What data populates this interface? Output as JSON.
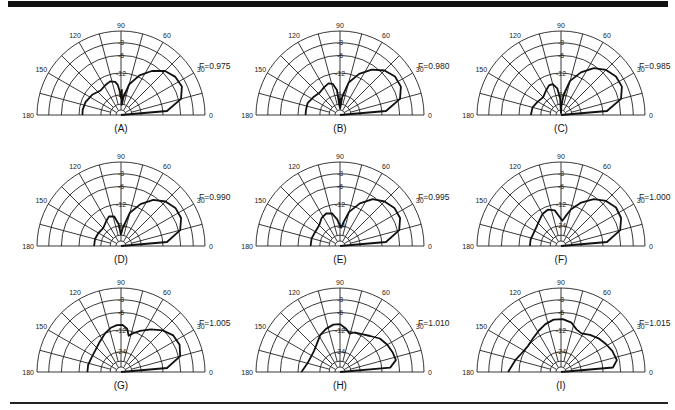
{
  "figure": {
    "panels_layout": "3x3",
    "radial_scale_db": [
      "0",
      "-3",
      "-6",
      "-12",
      "-24"
    ],
    "angle_ticks": [
      "0",
      "30",
      "60",
      "90",
      "120",
      "150",
      "180"
    ]
  },
  "chart_data": [
    {
      "type": "polar",
      "label": "(A)",
      "annotation": "F=0.975",
      "angles_deg": [
        0,
        30,
        60,
        90,
        120,
        150,
        180
      ],
      "radial_ticks_db": [
        -3,
        -6,
        -12,
        -24
      ],
      "curve": [
        [
          0,
          0.0
        ],
        [
          5,
          0.55
        ],
        [
          15,
          0.74
        ],
        [
          25,
          0.8
        ],
        [
          35,
          0.79
        ],
        [
          45,
          0.74
        ],
        [
          55,
          0.64
        ],
        [
          65,
          0.52
        ],
        [
          75,
          0.38
        ],
        [
          82,
          0.22
        ],
        [
          86,
          0.12
        ],
        [
          88,
          0.3
        ],
        [
          90,
          0.2
        ],
        [
          93,
          0.28
        ],
        [
          96,
          0.36
        ],
        [
          100,
          0.4
        ],
        [
          108,
          0.42
        ],
        [
          118,
          0.4
        ],
        [
          130,
          0.38
        ],
        [
          145,
          0.42
        ],
        [
          160,
          0.45
        ],
        [
          172,
          0.46
        ],
        [
          180,
          0.46
        ]
      ]
    },
    {
      "type": "polar",
      "label": "(B)",
      "annotation": "F=0.980",
      "angles_deg": [
        0,
        30,
        60,
        90,
        120,
        150,
        180
      ],
      "radial_ticks_db": [
        -3,
        -6,
        -12,
        -24
      ],
      "curve": [
        [
          0,
          0.0
        ],
        [
          5,
          0.55
        ],
        [
          15,
          0.74
        ],
        [
          25,
          0.8
        ],
        [
          35,
          0.8
        ],
        [
          45,
          0.75
        ],
        [
          55,
          0.66
        ],
        [
          65,
          0.54
        ],
        [
          75,
          0.4
        ],
        [
          83,
          0.22
        ],
        [
          88,
          0.08
        ],
        [
          90,
          0.2
        ],
        [
          93,
          0.1
        ],
        [
          97,
          0.3
        ],
        [
          103,
          0.38
        ],
        [
          110,
          0.4
        ],
        [
          120,
          0.38
        ],
        [
          132,
          0.36
        ],
        [
          145,
          0.38
        ],
        [
          160,
          0.41
        ],
        [
          172,
          0.41
        ],
        [
          180,
          0.41
        ]
      ]
    },
    {
      "type": "polar",
      "label": "(C)",
      "annotation": "F=0.985",
      "angles_deg": [
        0,
        30,
        60,
        90,
        120,
        150,
        180
      ],
      "radial_ticks_db": [
        -3,
        -6,
        -12,
        -24
      ],
      "curve": [
        [
          0,
          0.0
        ],
        [
          5,
          0.55
        ],
        [
          15,
          0.74
        ],
        [
          25,
          0.8
        ],
        [
          35,
          0.8
        ],
        [
          45,
          0.76
        ],
        [
          55,
          0.68
        ],
        [
          65,
          0.56
        ],
        [
          75,
          0.42
        ],
        [
          83,
          0.24
        ],
        [
          88,
          0.1
        ],
        [
          90,
          0.02
        ],
        [
          93,
          0.2
        ],
        [
          98,
          0.32
        ],
        [
          105,
          0.38
        ],
        [
          112,
          0.38
        ],
        [
          122,
          0.34
        ],
        [
          135,
          0.3
        ],
        [
          150,
          0.32
        ],
        [
          165,
          0.35
        ],
        [
          180,
          0.36
        ]
      ]
    },
    {
      "type": "polar",
      "label": "(D)",
      "annotation": "F=0.990",
      "angles_deg": [
        0,
        30,
        60,
        90,
        120,
        150,
        180
      ],
      "radial_ticks_db": [
        -3,
        -6,
        -12,
        -24
      ],
      "curve": [
        [
          0,
          0.0
        ],
        [
          5,
          0.55
        ],
        [
          15,
          0.73
        ],
        [
          25,
          0.79
        ],
        [
          35,
          0.79
        ],
        [
          45,
          0.75
        ],
        [
          55,
          0.67
        ],
        [
          65,
          0.55
        ],
        [
          75,
          0.41
        ],
        [
          84,
          0.22
        ],
        [
          88,
          0.16
        ],
        [
          91,
          0.14
        ],
        [
          96,
          0.26
        ],
        [
          103,
          0.36
        ],
        [
          112,
          0.38
        ],
        [
          122,
          0.34
        ],
        [
          135,
          0.3
        ],
        [
          150,
          0.31
        ],
        [
          165,
          0.32
        ],
        [
          180,
          0.32
        ]
      ]
    },
    {
      "type": "polar",
      "label": "(E)",
      "annotation": "F=0.995",
      "angles_deg": [
        0,
        30,
        60,
        90,
        120,
        150,
        180
      ],
      "radial_ticks_db": [
        -3,
        -6,
        -12,
        -24
      ],
      "curve": [
        [
          0,
          0.0
        ],
        [
          5,
          0.55
        ],
        [
          15,
          0.73
        ],
        [
          25,
          0.79
        ],
        [
          35,
          0.79
        ],
        [
          45,
          0.75
        ],
        [
          55,
          0.68
        ],
        [
          65,
          0.56
        ],
        [
          75,
          0.42
        ],
        [
          82,
          0.28
        ],
        [
          86,
          0.22
        ],
        [
          90,
          0.24
        ],
        [
          96,
          0.32
        ],
        [
          104,
          0.4
        ],
        [
          113,
          0.42
        ],
        [
          123,
          0.4
        ],
        [
          135,
          0.35
        ],
        [
          150,
          0.34
        ],
        [
          165,
          0.35
        ],
        [
          180,
          0.35
        ]
      ]
    },
    {
      "type": "polar",
      "label": "(F)",
      "annotation": "F=1.000",
      "angles_deg": [
        0,
        30,
        60,
        90,
        120,
        150,
        180
      ],
      "radial_ticks_db": [
        -3,
        -6,
        -12,
        -24
      ],
      "curve": [
        [
          0,
          0.0
        ],
        [
          5,
          0.55
        ],
        [
          15,
          0.73
        ],
        [
          25,
          0.79
        ],
        [
          35,
          0.8
        ],
        [
          45,
          0.76
        ],
        [
          55,
          0.68
        ],
        [
          65,
          0.57
        ],
        [
          75,
          0.45
        ],
        [
          82,
          0.35
        ],
        [
          87,
          0.3
        ],
        [
          92,
          0.34
        ],
        [
          100,
          0.43
        ],
        [
          110,
          0.46
        ],
        [
          120,
          0.44
        ],
        [
          130,
          0.4
        ],
        [
          142,
          0.37
        ],
        [
          155,
          0.36
        ],
        [
          168,
          0.37
        ],
        [
          180,
          0.37
        ]
      ]
    },
    {
      "type": "polar",
      "label": "(G)",
      "annotation": "F=1.005",
      "angles_deg": [
        0,
        30,
        60,
        90,
        120,
        150,
        180
      ],
      "radial_ticks_db": [
        -3,
        -6,
        -12,
        -24
      ],
      "curve": [
        [
          0,
          0.0
        ],
        [
          5,
          0.55
        ],
        [
          15,
          0.73
        ],
        [
          25,
          0.77
        ],
        [
          35,
          0.76
        ],
        [
          45,
          0.7
        ],
        [
          55,
          0.62
        ],
        [
          65,
          0.54
        ],
        [
          73,
          0.48
        ],
        [
          78,
          0.44
        ],
        [
          82,
          0.52
        ],
        [
          88,
          0.56
        ],
        [
          95,
          0.56
        ],
        [
          103,
          0.54
        ],
        [
          112,
          0.5
        ],
        [
          125,
          0.44
        ],
        [
          140,
          0.4
        ],
        [
          155,
          0.39
        ],
        [
          168,
          0.4
        ],
        [
          180,
          0.4
        ]
      ]
    },
    {
      "type": "polar",
      "label": "(H)",
      "annotation": "F=1.010",
      "angles_deg": [
        0,
        30,
        60,
        90,
        120,
        150,
        180
      ],
      "radial_ticks_db": [
        -3,
        -6,
        -12,
        -24
      ],
      "curve": [
        [
          0,
          0.0
        ],
        [
          5,
          0.6
        ],
        [
          12,
          0.68
        ],
        [
          20,
          0.67
        ],
        [
          30,
          0.65
        ],
        [
          40,
          0.62
        ],
        [
          50,
          0.56
        ],
        [
          60,
          0.52
        ],
        [
          70,
          0.5
        ],
        [
          76,
          0.47
        ],
        [
          82,
          0.52
        ],
        [
          90,
          0.57
        ],
        [
          98,
          0.57
        ],
        [
          108,
          0.54
        ],
        [
          118,
          0.5
        ],
        [
          128,
          0.44
        ],
        [
          140,
          0.4
        ],
        [
          152,
          0.39
        ],
        [
          165,
          0.4
        ],
        [
          180,
          0.46
        ]
      ]
    },
    {
      "type": "polar",
      "label": "(I)",
      "annotation": "F=1.015",
      "angles_deg": [
        0,
        30,
        60,
        90,
        120,
        150,
        180
      ],
      "radial_ticks_db": [
        -3,
        -6,
        -12,
        -24
      ],
      "curve": [
        [
          0,
          0.0
        ],
        [
          5,
          0.62
        ],
        [
          12,
          0.68
        ],
        [
          22,
          0.66
        ],
        [
          32,
          0.63
        ],
        [
          42,
          0.6
        ],
        [
          52,
          0.56
        ],
        [
          62,
          0.52
        ],
        [
          70,
          0.54
        ],
        [
          78,
          0.6
        ],
        [
          88,
          0.63
        ],
        [
          98,
          0.63
        ],
        [
          108,
          0.6
        ],
        [
          118,
          0.56
        ],
        [
          130,
          0.52
        ],
        [
          142,
          0.5
        ],
        [
          155,
          0.52
        ],
        [
          165,
          0.56
        ],
        [
          180,
          0.63
        ]
      ]
    }
  ]
}
